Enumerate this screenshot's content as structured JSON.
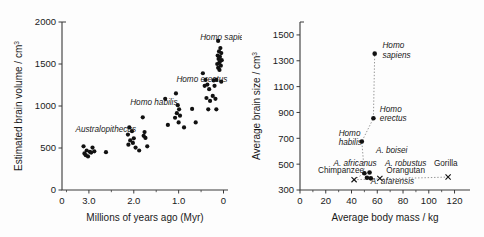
{
  "figure": {
    "name": "hominid-brain-evolution-figure",
    "panel_count": 2
  },
  "chart_data": [
    {
      "id": "left",
      "type": "scatter",
      "title": "",
      "xlabel": "Millions of years ago (Myr)",
      "ylabel": "Estimated brain volume / cm",
      "ylabel_sup": "3",
      "xlim": [
        3.6,
        -0.1
      ],
      "ylim": [
        0,
        2000
      ],
      "x_reversed": true,
      "xticks": [
        3.0,
        2.0,
        1.0,
        0
      ],
      "xticklabels": [
        "3.0",
        "2.0",
        "1.0",
        "0"
      ],
      "x_origin_label": "0",
      "yticks": [
        0,
        500,
        1000,
        1500,
        2000
      ],
      "yticklabels": [
        "0",
        "500",
        "1000",
        "1500",
        "2000"
      ],
      "grid": false,
      "legend": "none",
      "annotations": [
        {
          "text": "Australopithecus",
          "x": 3.3,
          "y": 690,
          "style": "italic"
        },
        {
          "text": "Homo habilis",
          "x": 2.08,
          "y": 1010,
          "style": "italic"
        },
        {
          "text": "Homo erectus",
          "x": 1.05,
          "y": 1285,
          "style": "italic"
        },
        {
          "text": "Homo sapiens",
          "x": 0.52,
          "y": 1790,
          "style": "italic"
        }
      ],
      "points": [
        {
          "x": 3.12,
          "y": 520
        },
        {
          "x": 3.05,
          "y": 470
        },
        {
          "x": 2.98,
          "y": 455
        },
        {
          "x": 3.1,
          "y": 435
        },
        {
          "x": 3.02,
          "y": 400
        },
        {
          "x": 2.92,
          "y": 505
        },
        {
          "x": 2.95,
          "y": 445
        },
        {
          "x": 3.07,
          "y": 415
        },
        {
          "x": 2.88,
          "y": 460
        },
        {
          "x": 2.62,
          "y": 450
        },
        {
          "x": 2.1,
          "y": 745
        },
        {
          "x": 2.04,
          "y": 700
        },
        {
          "x": 2.13,
          "y": 660
        },
        {
          "x": 2.0,
          "y": 615
        },
        {
          "x": 2.08,
          "y": 590
        },
        {
          "x": 2.02,
          "y": 560
        },
        {
          "x": 2.12,
          "y": 540
        },
        {
          "x": 1.96,
          "y": 505
        },
        {
          "x": 1.88,
          "y": 470
        },
        {
          "x": 1.8,
          "y": 865
        },
        {
          "x": 1.76,
          "y": 690
        },
        {
          "x": 1.78,
          "y": 645
        },
        {
          "x": 1.74,
          "y": 620
        },
        {
          "x": 1.7,
          "y": 520
        },
        {
          "x": 1.3,
          "y": 1085
        },
        {
          "x": 1.06,
          "y": 1150
        },
        {
          "x": 1.02,
          "y": 1010
        },
        {
          "x": 0.99,
          "y": 960
        },
        {
          "x": 1.04,
          "y": 915
        },
        {
          "x": 0.97,
          "y": 885
        },
        {
          "x": 1.08,
          "y": 860
        },
        {
          "x": 1.0,
          "y": 805
        },
        {
          "x": 1.24,
          "y": 775
        },
        {
          "x": 0.88,
          "y": 745
        },
        {
          "x": 0.7,
          "y": 965
        },
        {
          "x": 0.62,
          "y": 805
        },
        {
          "x": 0.46,
          "y": 1390
        },
        {
          "x": 0.4,
          "y": 1310
        },
        {
          "x": 0.36,
          "y": 1255
        },
        {
          "x": 0.42,
          "y": 1240
        },
        {
          "x": 0.32,
          "y": 1200
        },
        {
          "x": 0.38,
          "y": 1095
        },
        {
          "x": 0.3,
          "y": 1060
        },
        {
          "x": 0.34,
          "y": 960
        },
        {
          "x": 0.22,
          "y": 1305
        },
        {
          "x": 0.2,
          "y": 1240
        },
        {
          "x": 0.24,
          "y": 1120
        },
        {
          "x": 0.18,
          "y": 1085
        },
        {
          "x": 0.16,
          "y": 960
        },
        {
          "x": 0.12,
          "y": 1775
        },
        {
          "x": 0.07,
          "y": 1690
        },
        {
          "x": 0.1,
          "y": 1650
        },
        {
          "x": 0.05,
          "y": 1630
        },
        {
          "x": 0.13,
          "y": 1600
        },
        {
          "x": 0.08,
          "y": 1585
        },
        {
          "x": 0.11,
          "y": 1560
        },
        {
          "x": 0.04,
          "y": 1545
        },
        {
          "x": 0.09,
          "y": 1520
        },
        {
          "x": 0.14,
          "y": 1500
        },
        {
          "x": 0.06,
          "y": 1480
        },
        {
          "x": 0.12,
          "y": 1455
        },
        {
          "x": 0.09,
          "y": 1430
        },
        {
          "x": 0.16,
          "y": 1310
        },
        {
          "x": 0.05,
          "y": 1290
        }
      ]
    },
    {
      "id": "right",
      "type": "scatter",
      "title": "",
      "xlabel": "Average body mass / kg",
      "ylabel": "Average brain size / cm",
      "ylabel_sup": "3",
      "xlim": [
        0,
        132
      ],
      "ylim": [
        300,
        1600
      ],
      "x_reversed": false,
      "xticks": [
        0,
        20,
        40,
        60,
        80,
        100,
        120
      ],
      "xticklabels": [
        "0",
        "20",
        "40",
        "60",
        "80",
        "100",
        "120"
      ],
      "yticks": [
        300,
        500,
        700,
        900,
        1100,
        1300,
        1500
      ],
      "yticklabels": [
        "300",
        "500",
        "700",
        "900",
        "1100",
        "1300",
        "1500"
      ],
      "grid": false,
      "legend": "none",
      "points": [
        {
          "name": "Homo sapiens",
          "x": 58,
          "y": 1355,
          "marker": "circle"
        },
        {
          "name": "Homo erectus",
          "x": 57,
          "y": 855,
          "marker": "circle"
        },
        {
          "name": "Homo habilis",
          "x": 48,
          "y": 675,
          "marker": "circle"
        },
        {
          "name": "A. africanus",
          "x": 50,
          "y": 430,
          "marker": "circle"
        },
        {
          "name": "A. boisei",
          "x": 54,
          "y": 435,
          "marker": "circle"
        },
        {
          "name": "A. robustus",
          "x": 52,
          "y": 395,
          "marker": "circle"
        },
        {
          "name": "A. afarensis",
          "x": 55,
          "y": 390,
          "marker": "circle"
        },
        {
          "name": "Chimpanzee",
          "x": 42,
          "y": 380,
          "marker": "cross"
        },
        {
          "name": "Orangutan",
          "x": 62,
          "y": 390,
          "marker": "cross"
        },
        {
          "name": "Gorilla",
          "x": 115,
          "y": 400,
          "marker": "cross"
        }
      ],
      "trend_line": {
        "style": "dotted",
        "x": [
          42,
          50,
          48,
          57,
          58
        ],
        "y": [
          380,
          430,
          675,
          855,
          1355
        ]
      },
      "baseline_dotted": {
        "style": "dotted",
        "x": [
          42,
          115
        ],
        "y": [
          380,
          400
        ]
      },
      "annotations": [
        {
          "text": "Homo sapiens",
          "style": "italic",
          "lines": [
            "Homo",
            "sapiens"
          ],
          "x": 64,
          "y": 1395
        },
        {
          "text": "Homo erectus",
          "style": "italic",
          "lines": [
            "Homo",
            "erectus"
          ],
          "x": 62,
          "y": 905
        },
        {
          "text": "Homo habilis",
          "style": "italic",
          "lines": [
            "Homo",
            "habilis"
          ],
          "x": 30,
          "y": 720
        },
        {
          "text": "A. boisei",
          "style": "italic",
          "x": 59,
          "y": 590
        },
        {
          "text": "A. africanus",
          "style": "italic",
          "x": 26,
          "y": 485
        },
        {
          "text": "A. robustus",
          "style": "italic",
          "x": 66,
          "y": 485
        },
        {
          "text": "A. afarensis",
          "style": "italic",
          "x": 55,
          "y": 345
        },
        {
          "text": "Chimpanzee",
          "style": "normal",
          "x": 14,
          "y": 430
        },
        {
          "text": "Orangutan",
          "style": "normal",
          "x": 67,
          "y": 435
        },
        {
          "text": "Gorilla",
          "style": "normal",
          "x": 104,
          "y": 485
        }
      ]
    }
  ]
}
